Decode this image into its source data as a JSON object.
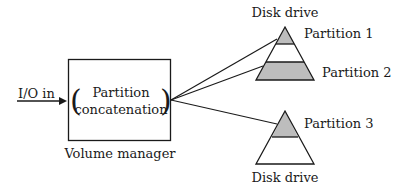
{
  "diagram": {
    "input_label": "I/O in",
    "volume_manager": {
      "inner_line1": "Partition",
      "inner_line2": "concatenation",
      "open_paren": "(",
      "close_paren": ")",
      "caption": "Volume manager"
    },
    "disks": [
      {
        "label": "Disk drive",
        "partitions": [
          {
            "label": "Partition 1",
            "shaded": true
          },
          {
            "label": "Partition 2",
            "shaded": true
          }
        ]
      },
      {
        "label": "Disk drive",
        "partitions": [
          {
            "label": "Partition 3",
            "shaded": true
          }
        ]
      }
    ],
    "colors": {
      "shade": "#bdbdbd",
      "stroke": "#1a1a1a"
    }
  }
}
